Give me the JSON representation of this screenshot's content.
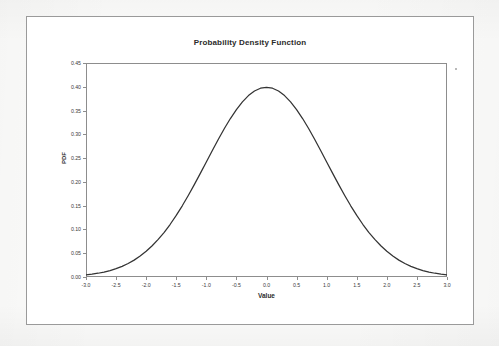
{
  "chart_data": {
    "type": "line",
    "title": "Probability Density Function",
    "xlabel": "Value",
    "ylabel": "PDF",
    "xlim": [
      -3.0,
      3.0
    ],
    "ylim": [
      0.0,
      0.45
    ],
    "grid": false,
    "legend": null,
    "x_ticks": [
      "-3.0",
      "-2.5",
      "-2.0",
      "-1.5",
      "-1.0",
      "-0.5",
      "0.0",
      "0.5",
      "1.0",
      "1.5",
      "2.0",
      "2.5",
      "3.0"
    ],
    "y_ticks": [
      "0.00",
      "0.05",
      "0.10",
      "0.15",
      "0.20",
      "0.25",
      "0.30",
      "0.35",
      "0.40",
      "0.45"
    ],
    "series": [
      {
        "name": "PDF",
        "color": "#333333",
        "x": [
          -3.0,
          -2.9,
          -2.8,
          -2.7,
          -2.6,
          -2.5,
          -2.4,
          -2.3,
          -2.2,
          -2.1,
          -2.0,
          -1.9,
          -1.8,
          -1.7,
          -1.6,
          -1.5,
          -1.4,
          -1.3,
          -1.2,
          -1.1,
          -1.0,
          -0.9,
          -0.8,
          -0.7,
          -0.6,
          -0.5,
          -0.4,
          -0.3,
          -0.2,
          -0.1,
          0.0,
          0.1,
          0.2,
          0.3,
          0.4,
          0.5,
          0.6,
          0.7,
          0.8,
          0.9,
          1.0,
          1.1,
          1.2,
          1.3,
          1.4,
          1.5,
          1.6,
          1.7,
          1.8,
          1.9,
          2.0,
          2.1,
          2.2,
          2.3,
          2.4,
          2.5,
          2.6,
          2.7,
          2.8,
          2.9,
          3.0
        ],
        "values": [
          0.0044,
          0.006,
          0.0079,
          0.0104,
          0.0136,
          0.0175,
          0.0224,
          0.0283,
          0.0355,
          0.044,
          0.054,
          0.0656,
          0.079,
          0.094,
          0.1109,
          0.1295,
          0.1497,
          0.1714,
          0.1942,
          0.2179,
          0.242,
          0.2661,
          0.2897,
          0.3123,
          0.3332,
          0.3521,
          0.3683,
          0.3814,
          0.391,
          0.397,
          0.3989,
          0.397,
          0.391,
          0.3814,
          0.3683,
          0.3521,
          0.3332,
          0.3123,
          0.2897,
          0.2661,
          0.242,
          0.2179,
          0.1942,
          0.1714,
          0.1497,
          0.1295,
          0.1109,
          0.094,
          0.079,
          0.0656,
          0.054,
          0.044,
          0.0355,
          0.0283,
          0.0224,
          0.0175,
          0.0136,
          0.0104,
          0.0079,
          0.006,
          0.0044
        ]
      }
    ]
  }
}
